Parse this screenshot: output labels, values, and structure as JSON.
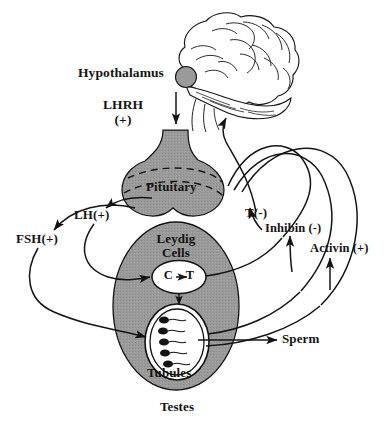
{
  "figure": {
    "background_color": "#ffffff",
    "ink_color": "#141414",
    "organ_fill_color": "#9a9a9a",
    "organ_fill_color_dark": "#8e8e8e",
    "white_fill_color": "#ffffff"
  },
  "labels": {
    "hypothalamus": "Hypothalamus",
    "lhrh": "LHRH\n(+)",
    "lhrh_line1": "LHRH",
    "lhrh_line2": "(+)",
    "pituitary": "Pituitary",
    "lh": "LH(+)",
    "fsh": "FSH(+)",
    "t_negative": "T(-)",
    "inhibin": "Inhibin (-)",
    "activin": "Activin (+)",
    "leydig_line1": "Leydig",
    "leydig_line2": "Cells",
    "conversion": "C",
    "conversion_target": "T",
    "sperm": "Sperm",
    "tubules": "Tubules",
    "testes": "Testes"
  },
  "structures": [
    {
      "name": "brain",
      "label": "Hypothalamus",
      "kind": "line-art-organ"
    },
    {
      "name": "hypothalamus-marker",
      "label": "Hypothalamus",
      "kind": "filled-circle"
    },
    {
      "name": "pituitary",
      "label": "Pituitary",
      "kind": "filled-organ"
    },
    {
      "name": "testis",
      "label": "Testes",
      "kind": "filled-ellipse"
    },
    {
      "name": "leydig-cell",
      "label": "Leydig Cells",
      "kind": "white-ellipse"
    },
    {
      "name": "seminiferous-tubule",
      "label": "Tubules",
      "kind": "white-ellipse"
    }
  ],
  "signals": [
    {
      "name": "lhrh",
      "label": "LHRH (+)",
      "sign": "+",
      "from": "hypothalamus",
      "to": "pituitary"
    },
    {
      "name": "lh",
      "label": "LH(+)",
      "sign": "+",
      "from": "pituitary",
      "to": "leydig-cell"
    },
    {
      "name": "fsh",
      "label": "FSH(+)",
      "sign": "+",
      "from": "pituitary",
      "to": "seminiferous-tubule"
    },
    {
      "name": "t",
      "label": "T(-)",
      "sign": "-",
      "from": "leydig-cell",
      "to": "pituitary"
    },
    {
      "name": "inhibin",
      "label": "Inhibin (-)",
      "sign": "-",
      "from": "seminiferous-tubule",
      "to": "pituitary"
    },
    {
      "name": "activin",
      "label": "Activin (+)",
      "sign": "+",
      "from": "seminiferous-tubule",
      "to": "pituitary"
    },
    {
      "name": "sperm",
      "label": "Sperm",
      "sign": "",
      "from": "seminiferous-tubule",
      "to": "sperm-output"
    },
    {
      "name": "conversion",
      "label": "C -> T",
      "sign": "",
      "from": "cholesterol",
      "to": "testosterone"
    }
  ],
  "sperm_cells_count": 5
}
